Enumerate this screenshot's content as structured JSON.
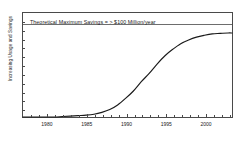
{
  "chart_data": {
    "type": "line",
    "title": "",
    "xlabel": "",
    "ylabel": "Increasing Usage and Savings",
    "xlim": [
      1977,
      2003.5
    ],
    "ylim": [
      0,
      1.12
    ],
    "grid": false,
    "legend": null,
    "annotations": [
      {
        "name": "theoretical-maximum-savings",
        "text": "Theoretical Maximum Savings = > $100 Million/year",
        "type": "horizontal-reference-line",
        "y": 1.0
      }
    ],
    "xticks_major": [
      1980,
      1985,
      1990,
      1995,
      2000
    ],
    "xtick_labels": [
      "1980",
      "1985",
      "1990",
      "1995",
      "2000"
    ],
    "xticks_minor": [
      1978,
      1979,
      1981,
      1982,
      1983,
      1984,
      1986,
      1987,
      1988,
      1989,
      1991,
      1992,
      1993,
      1994,
      1996,
      1997,
      1998,
      1999,
      2001,
      2002,
      2003
    ],
    "yticks_count": 12,
    "ytick_labels": [],
    "series": [
      {
        "name": "Usage and Savings",
        "color": "#1a1a1a",
        "x": [
          1977,
          1978,
          1979,
          1980,
          1981,
          1982,
          1983,
          1984,
          1985,
          1986,
          1987,
          1988,
          1989,
          1990,
          1991,
          1992,
          1993,
          1994,
          1995,
          1996,
          1997,
          1998,
          1999,
          2000,
          2001,
          2002,
          2003,
          2003.5
        ],
        "values": [
          0.0,
          0.0,
          0.0,
          0.0,
          0.0,
          0.005,
          0.01,
          0.015,
          0.02,
          0.03,
          0.05,
          0.08,
          0.13,
          0.2,
          0.28,
          0.38,
          0.47,
          0.57,
          0.66,
          0.73,
          0.79,
          0.83,
          0.86,
          0.88,
          0.895,
          0.9,
          0.905,
          0.905
        ]
      }
    ]
  },
  "axis": {
    "ylabel": "Increasing Usage and Savings"
  }
}
